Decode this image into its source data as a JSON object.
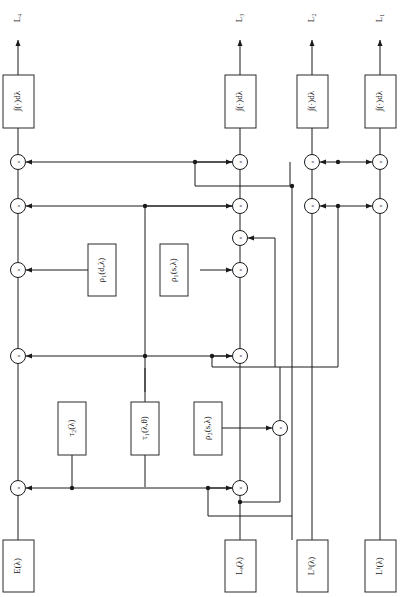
{
  "figure": {
    "kind": "block-diagram",
    "orientation_note": "rotated-90-ccw",
    "outputs": [
      {
        "id": "L4",
        "label": "L₄"
      },
      {
        "id": "L3",
        "label": "L₃"
      },
      {
        "id": "L2",
        "label": "L₂"
      },
      {
        "id": "L1",
        "label": "L₁"
      }
    ],
    "integrators": [
      {
        "id": "int4",
        "label": "∫(·)dλ"
      },
      {
        "id": "int3",
        "label": "∫(·)dλ"
      },
      {
        "id": "int2",
        "label": "∫(·)dλ"
      },
      {
        "id": "int1",
        "label": "∫(·)dλ"
      }
    ],
    "sources": [
      {
        "id": "E",
        "label": "E(λ)"
      },
      {
        "id": "Le",
        "label": "Lₑ(λ)"
      },
      {
        "id": "Lb",
        "label": "Lᵇ(λ)"
      },
      {
        "id": "Lf",
        "label": "Lᶠ(λ)"
      }
    ],
    "blocks": [
      {
        "id": "rho1d",
        "label": "ρ₁(d,λ)"
      },
      {
        "id": "rho1s",
        "label": "ρ₁(s,λ)"
      },
      {
        "id": "tau2",
        "label": "τ₂(λ)"
      },
      {
        "id": "tau1",
        "label": "τ₁(λ,θ)"
      },
      {
        "id": "rho2s",
        "label": "ρ₂(s,λ)"
      }
    ],
    "multiplier_symbol": "×",
    "multiplier_count": 14,
    "colors": {
      "line": "#1a1a1a",
      "box_stroke": "#2b2b2b",
      "box_fill": "#ffffff",
      "background": "#ffffff"
    }
  }
}
